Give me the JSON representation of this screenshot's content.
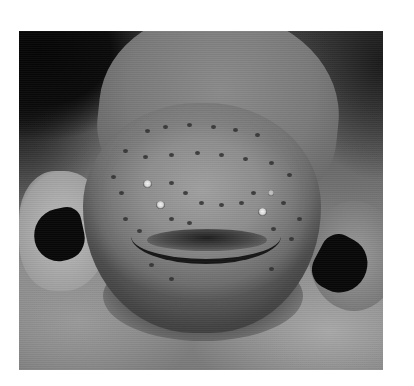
{
  "image": {
    "alt": "Grayscale close-up photograph of an electric eel's head facing the camera",
    "subject": "electric eel",
    "style": "grayscale photograph",
    "frame": {
      "left": 19,
      "top": 31,
      "width": 364,
      "height": 339
    },
    "colors": {
      "page_background": "#ffffff",
      "dark_background": "#050505",
      "eel_skin": "#8e8e8e",
      "fins": "#080808",
      "eyes_highlight": "#f4f4f4"
    }
  }
}
